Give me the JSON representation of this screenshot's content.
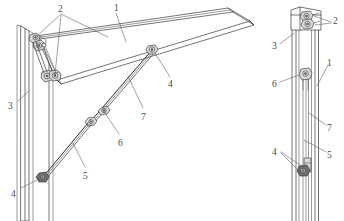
{
  "figure": {
    "background_color": "#ffffff",
    "line_color": "#3a3a3a",
    "label_color": "#4a4a4a",
    "views": [
      {
        "id": "left-view",
        "name": "perspective-open-view"
      },
      {
        "id": "right-view",
        "name": "side-closed-view"
      }
    ]
  },
  "callouts": {
    "left_view": [
      {
        "id": "l-2",
        "text": "2",
        "x": 58,
        "y": 5,
        "target": "upper-hinge-brackets"
      },
      {
        "id": "l-1",
        "text": "1",
        "x": 114,
        "y": 4,
        "target": "awning-panel"
      },
      {
        "id": "l-4a",
        "text": "4",
        "x": 168,
        "y": 80,
        "target": "panel-pivot-joint"
      },
      {
        "id": "l-7",
        "text": "7",
        "x": 141,
        "y": 113,
        "target": "upper-stay-arm"
      },
      {
        "id": "l-3",
        "text": "3",
        "x": 8,
        "y": 102,
        "target": "window-frame-jamb"
      },
      {
        "id": "l-6",
        "text": "6",
        "x": 118,
        "y": 139,
        "target": "stay-arm-slider"
      },
      {
        "id": "l-5",
        "text": "5",
        "x": 83,
        "y": 172,
        "target": "lower-stay-arm"
      },
      {
        "id": "l-4b",
        "text": "4",
        "x": 11,
        "y": 190,
        "target": "frame-slider-shoe"
      }
    ],
    "right_view": [
      {
        "id": "r-2",
        "text": "2",
        "x": 333,
        "y": 17,
        "target": "upper-hinge-brackets"
      },
      {
        "id": "r-3",
        "text": "3",
        "x": 272,
        "y": 42,
        "target": "window-frame-jamb"
      },
      {
        "id": "r-1",
        "text": "1",
        "x": 327,
        "y": 59,
        "target": "awning-panel"
      },
      {
        "id": "r-6",
        "text": "6",
        "x": 272,
        "y": 80,
        "target": "stay-arm-slider"
      },
      {
        "id": "r-7",
        "text": "7",
        "x": 327,
        "y": 124,
        "target": "upper-stay-arm"
      },
      {
        "id": "r-5",
        "text": "5",
        "x": 327,
        "y": 151,
        "target": "lower-stay-arm"
      },
      {
        "id": "r-4",
        "text": "4",
        "x": 272,
        "y": 148,
        "target": "frame-slider-shoe"
      }
    ]
  }
}
